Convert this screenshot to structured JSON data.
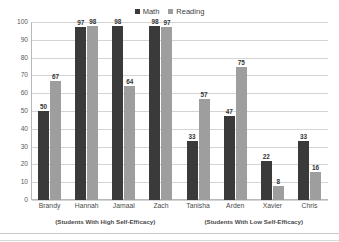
{
  "chart_data": {
    "type": "bar",
    "title": "",
    "xlabel": "",
    "ylabel": "",
    "ylim": [
      0,
      100
    ],
    "ytick_step": 10,
    "yticks": [
      100,
      90,
      80,
      70,
      60,
      50,
      40,
      30,
      20,
      10,
      0
    ],
    "grid": true,
    "legend_position": "top-center",
    "categories": [
      "Brandy",
      "Hannah",
      "Jamaal",
      "Zach",
      "Tanisha",
      "Arden",
      "Xavier",
      "Chris"
    ],
    "series": [
      {
        "name": "Math",
        "color": "#3a3a3a",
        "values": [
          50,
          97,
          98,
          98,
          33,
          47,
          22,
          33
        ]
      },
      {
        "name": "Reading",
        "color": "#9e9e9e",
        "values": [
          67,
          98,
          64,
          97,
          57,
          75,
          8,
          16
        ]
      }
    ],
    "group_annotations": [
      {
        "label": "(Students With High Self-Efficacy)",
        "categories": [
          "Brandy",
          "Hannah",
          "Jamaal",
          "Zach"
        ]
      },
      {
        "label": "(Students With Low Self-Efficacy)",
        "categories": [
          "Tanisha",
          "Arden",
          "Xavier",
          "Chris"
        ]
      }
    ]
  },
  "colors": {
    "math": "#3a3a3a",
    "reading": "#9e9e9e",
    "gridline": "#d4d4d4",
    "axis": "#b8b8b8",
    "background": "#ffffff"
  }
}
